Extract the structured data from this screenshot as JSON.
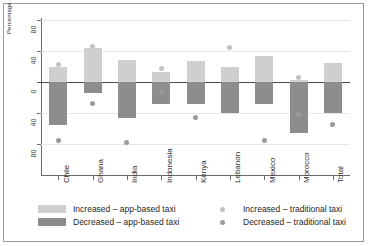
{
  "chart_data": {
    "type": "bar",
    "title": "",
    "xlabel": "",
    "ylabel": "Percentage of respondents",
    "ylim": [
      -80,
      80
    ],
    "yticks": [
      80,
      40,
      0,
      40,
      80
    ],
    "ytick_values": [
      80,
      40,
      0,
      -40,
      -80
    ],
    "grid": true,
    "legend_position": "below",
    "categories": [
      "Chile",
      "Ghana",
      "India",
      "Indonesia",
      "Kenya",
      "Lebanon",
      "Mexico",
      "Morocco",
      "Total"
    ],
    "series": [
      {
        "name": "Increased – app-based taxi",
        "kind": "bar",
        "color": "#cfcfcf",
        "values": [
          19,
          44,
          28,
          13,
          27,
          19,
          34,
          2,
          24
        ]
      },
      {
        "name": "Decreased – app-based taxi",
        "kind": "bar",
        "color": "#8d8d8d",
        "values": [
          -55,
          -14,
          -46,
          -29,
          -29,
          -40,
          -28,
          -66,
          -40
        ]
      },
      {
        "name": "Increased – traditional taxi",
        "kind": "scatter",
        "color": "#c2c2c2",
        "values": [
          22,
          46,
          null,
          18,
          null,
          44,
          null,
          6,
          null
        ]
      },
      {
        "name": "Decreased – traditional taxi",
        "kind": "scatter",
        "color": "#9a9a9a",
        "values": [
          -75,
          -28,
          -78,
          -14,
          -46,
          null,
          -75,
          -42,
          -55
        ]
      }
    ]
  },
  "axis": {
    "y_label": "Percentage of respondents",
    "y_ticks": [
      "80",
      "40",
      "0",
      "40",
      "80"
    ],
    "x_ticks": [
      "Chile",
      "Ghana",
      "India",
      "Indonesia",
      "Kenya",
      "Lebanon",
      "Mexico",
      "Morocco",
      "Total"
    ]
  },
  "legend": {
    "items": [
      {
        "label": "Increased – app-based taxi",
        "marker": "square-swatch",
        "color": "#cfcfcf"
      },
      {
        "label": "Decreased – app-based taxi",
        "marker": "square-swatch",
        "color": "#8d8d8d"
      },
      {
        "label": "Increased – traditional taxi",
        "marker": "circle-dot",
        "color": "#c2c2c2"
      },
      {
        "label": "Decreased – traditional taxi",
        "marker": "circle-dot",
        "color": "#9a9a9a"
      }
    ]
  }
}
